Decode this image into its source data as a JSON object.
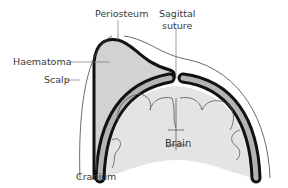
{
  "diagram": {
    "labels": {
      "periosteum": "Periosteum",
      "sagittal_line1": "Sagittal",
      "sagittal_line2": "suture",
      "haematoma": "Haematoma",
      "scalp": "Scalp",
      "cranium": "Cranium",
      "brain": "Brain"
    },
    "colors": {
      "bone_outline": "#111111",
      "bone_fill": "#b4b4b4",
      "haematoma_fill": "#d2d2d2",
      "brain_fill": "#e4e4e4",
      "scalp_line": "#444444",
      "leader_line": "#777777"
    }
  }
}
